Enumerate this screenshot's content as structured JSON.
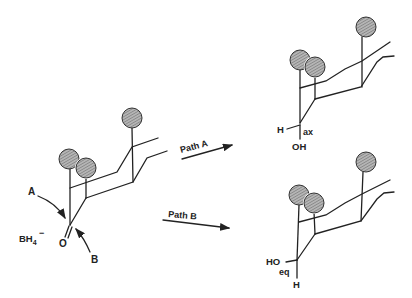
{
  "figure": {
    "reagent": {
      "label": "BH",
      "subscript": "4",
      "charge": "−"
    },
    "attack_labels": {
      "a": "A",
      "b": "B"
    },
    "carbonyl_oxygen": "O",
    "paths": [
      {
        "label": "Path A"
      },
      {
        "label": "Path B"
      }
    ],
    "product_a": {
      "h_label": "H",
      "oh_label": "OH",
      "position_label": "ax"
    },
    "product_b": {
      "ho_label": "HO",
      "h_label": "H",
      "position_label": "eq"
    },
    "colors": {
      "line": "#222222",
      "sphere_fill": "#9a9a9a",
      "background": "#ffffff"
    }
  }
}
